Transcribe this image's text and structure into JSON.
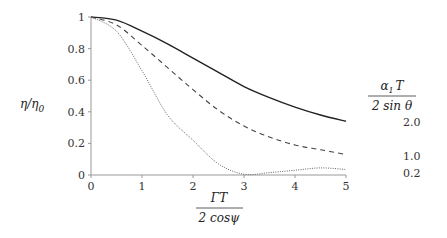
{
  "chart_data": {
    "type": "line",
    "title": "",
    "xlabel": "ΓT / (2 cos ψ)",
    "xlabel_num": "ΓT",
    "xlabel_den": "2 cosψ",
    "ylabel": "η/η₀",
    "ylabel_main": "η/η",
    "ylabel_sub": "0",
    "xlim": [
      0,
      5
    ],
    "ylim": [
      0,
      1
    ],
    "xticks": [
      "0",
      "1",
      "2",
      "3",
      "4",
      "5"
    ],
    "yticks": [
      "0",
      "0.2",
      "0.4",
      "0.6",
      "0.8",
      "1"
    ],
    "grid": false,
    "legend_title_num": "α₁T",
    "legend_title_num_main": "α",
    "legend_title_num_sub": "1",
    "legend_title_num_tail": "T",
    "legend_title_den": "2 sin θ",
    "legend_position": "right",
    "x": [
      0,
      0.5,
      1,
      1.5,
      2,
      2.5,
      3,
      3.5,
      4,
      4.5,
      5
    ],
    "series": [
      {
        "name": "2.0",
        "style": "solid",
        "values": [
          1.0,
          0.98,
          0.91,
          0.83,
          0.74,
          0.65,
          0.56,
          0.49,
          0.43,
          0.38,
          0.34
        ]
      },
      {
        "name": "1.0",
        "style": "dashed",
        "values": [
          1.0,
          0.95,
          0.82,
          0.68,
          0.54,
          0.41,
          0.31,
          0.24,
          0.19,
          0.16,
          0.13
        ]
      },
      {
        "name": "0.2",
        "style": "dotted",
        "values": [
          1.0,
          0.91,
          0.66,
          0.38,
          0.22,
          0.07,
          0.005,
          0.015,
          0.03,
          0.045,
          0.035
        ]
      }
    ]
  }
}
